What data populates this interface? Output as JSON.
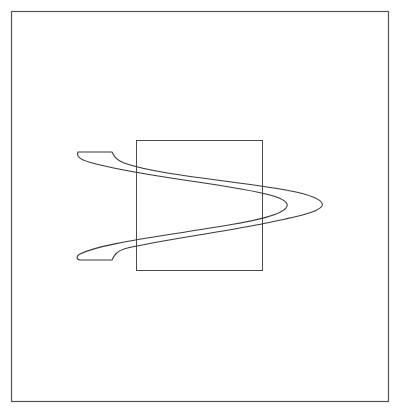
{
  "figure": {
    "colors": {
      "background": "#ffffff",
      "stroke": "#3a3a3a",
      "frame_stroke": "#555555"
    },
    "outer_frame": {
      "x": 11,
      "y": 11,
      "width": 377,
      "height": 390
    },
    "inner_rectangle": {
      "x": 136,
      "y": 140,
      "width": 126,
      "height": 130
    },
    "ribbon": {
      "top_tail_flat": {
        "x1": 78,
        "x2": 112,
        "y": 152
      },
      "bottom_tail_flat": {
        "x1": 78,
        "x2": 112,
        "y": 260
      },
      "outer_tip": {
        "x": 322,
        "y": 204
      },
      "inner_tip": {
        "x": 287,
        "y": 205
      }
    }
  }
}
